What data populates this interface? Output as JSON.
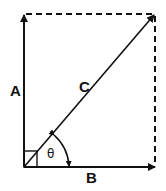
{
  "diagram": {
    "labels": {
      "a": "A",
      "b": "B",
      "c": "C",
      "theta": "θ"
    },
    "colors": {
      "stroke": "#111111",
      "background": "#ffffff"
    }
  }
}
